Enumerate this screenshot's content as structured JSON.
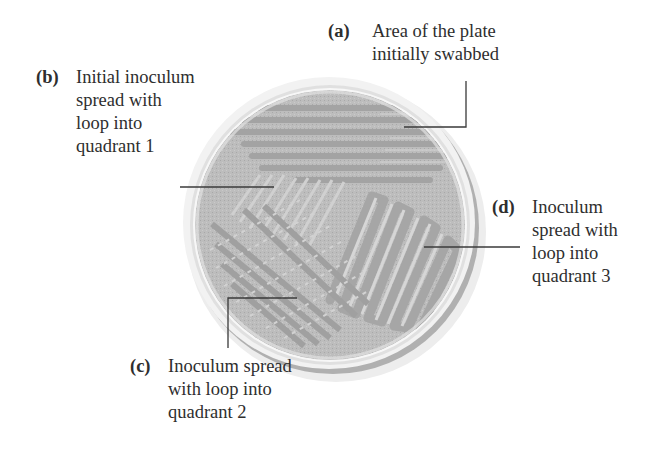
{
  "figure": {
    "colors": {
      "background": "#ffffff",
      "plate_rim_outer": "#e4e4e4",
      "plate_rim_inner": "#f4f4f4",
      "plate_shadow": "#a9a9a9",
      "agar": "#bdbdbd",
      "streak": "#9e9e9e",
      "streak_light": "#d4d4d4",
      "leader_line": "#3a3a3a",
      "text": "#2e2e2e"
    },
    "labels": [
      {
        "id": "a",
        "tag": "(a)",
        "lines": [
          "Area of the plate",
          "initially swabbed"
        ]
      },
      {
        "id": "b",
        "tag": "(b)",
        "lines": [
          "Initial inoculum",
          "spread with",
          "loop into",
          "quadrant 1"
        ]
      },
      {
        "id": "c",
        "tag": "(c)",
        "lines": [
          "Inoculum spread",
          "with loop into",
          "quadrant 2"
        ]
      },
      {
        "id": "d",
        "tag": "(d)",
        "lines": [
          "Inoculum",
          "spread with",
          "loop into",
          "quadrant 3"
        ]
      }
    ]
  }
}
